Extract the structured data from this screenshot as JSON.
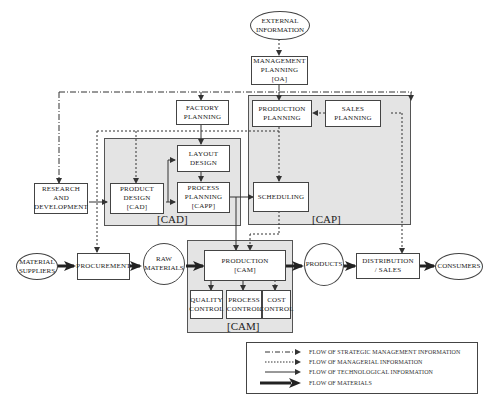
{
  "diagram": {
    "type": "flowchart",
    "nodes": {
      "external_information": "EXTERNAL\nINFORMATION",
      "management_planning": "MANAGEMENT\nPLANNING\n[OA]",
      "factory_planning": "FACTORY\nPLANNING",
      "production_planning": "PRODUCTION\nPLANNING",
      "sales_planning": "SALES\nPLANNING",
      "layout_design": "LAYOUT\nDESIGN",
      "research_development": "RESEARCH\nAND\nDEVELOPMENT",
      "product_design": "PRODUCT\nDESIGN\n[CAD]",
      "process_planning": "PROCESS\nPLANNING\n[CAPP]",
      "scheduling": "SCHEDULING",
      "material_suppliers": "MATERIAL\nSUPPLIERS",
      "procurement": "PROCUREMENT",
      "raw_materials": "RAW\nMATERIALS",
      "production": "PRODUCTION\n[CAM]",
      "quality_control": "QUALITY\nCONTROL",
      "process_control": "PROCESS\nCONTROL",
      "cost_control": "COST\nCONTROL",
      "products": "PRODUCTS",
      "distribution_sales": "DISTRIBUTION\n/ SALES",
      "consumers": "CONSUMERS"
    },
    "regions": {
      "cad": "[CAD]",
      "cap": "[CAP]",
      "cam": "[CAM]"
    },
    "legend": [
      {
        "style": "dash-dot",
        "label": "FLOW OF STRATEGIC MANAGEMENT INFORMATION"
      },
      {
        "style": "dotted",
        "label": "FLOW OF MANAGERIAL INFORMATION"
      },
      {
        "style": "solid-thin",
        "label": "FLOW OF TECHNOLOGICAL INFORMATION"
      },
      {
        "style": "solid-thick",
        "label": "FLOW OF MATERIALS"
      }
    ],
    "colors": {
      "line": "#333333",
      "region_fill": "#e4e4e4"
    }
  }
}
